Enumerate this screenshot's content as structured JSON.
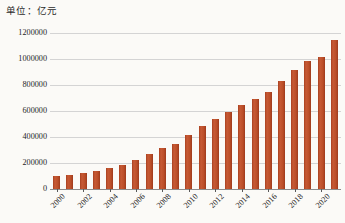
{
  "caption": {
    "unit_label": "单位：亿元"
  },
  "chart_data": {
    "type": "bar",
    "title": "",
    "subtitle": "",
    "unit": "单位：亿元",
    "xlabel": "",
    "ylabel": "",
    "ylim": [
      0,
      1200000
    ],
    "ytick_step": 200000,
    "grid": true,
    "legend": "none",
    "bar_color": "#bb4e28",
    "categories": [
      "2000",
      "2001",
      "2002",
      "2003",
      "2004",
      "2005",
      "2006",
      "2007",
      "2008",
      "2009",
      "2010",
      "2011",
      "2012",
      "2013",
      "2014",
      "2015",
      "2016",
      "2017",
      "2018",
      "2019",
      "2020",
      "2021"
    ],
    "xtick_labels_shown": [
      "2000",
      "2002",
      "2004",
      "2006",
      "2008",
      "2010",
      "2012",
      "2014",
      "2016",
      "2018",
      "2020"
    ],
    "ytick_labels": [
      "0",
      "200000",
      "400000",
      "600000",
      "800000",
      "1000000",
      "1200000"
    ],
    "values": [
      100280,
      110863,
      121717,
      137422,
      161840,
      187319,
      219439,
      270092,
      319245,
      348518,
      412119,
      487940,
      538580,
      592963,
      643563,
      688858,
      746395,
      832036,
      919281,
      986515,
      1013567,
      1143670
    ]
  }
}
